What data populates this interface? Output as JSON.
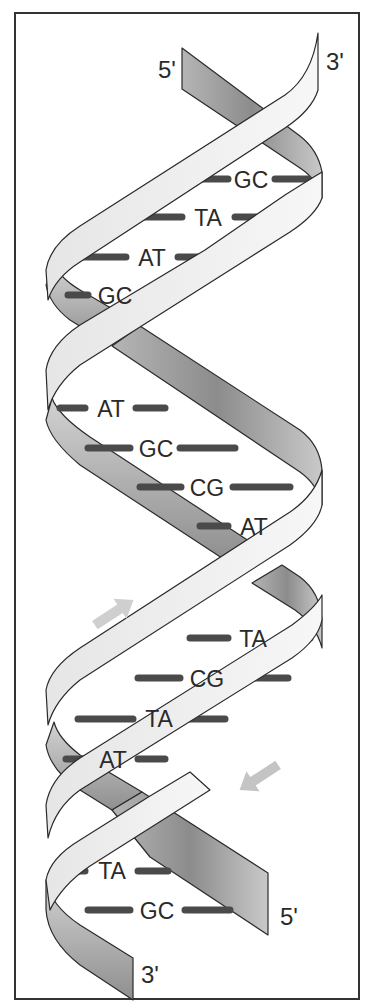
{
  "diagram": {
    "frame": {
      "border_color": "#333333",
      "background": "#ffffff"
    },
    "colors": {
      "light_strand": "#f2f2f2",
      "dark_strand_light": "#d0d0d0",
      "dark_strand_dark": "#8a8a8a",
      "bond": "#4a4a4a",
      "arrow": "#c8c8c8"
    },
    "end_labels": {
      "top_left": "5'",
      "top_right": "3'",
      "bottom_right": "5'",
      "bottom_left": "3'"
    },
    "base_pairs": [
      {
        "label": "GC",
        "y": 181
      },
      {
        "label": "TA",
        "y": 218
      },
      {
        "label": "AT",
        "y": 257
      },
      {
        "label": "GC",
        "y": 296
      },
      {
        "label": "AT",
        "y": 408
      },
      {
        "label": "GC",
        "y": 448
      },
      {
        "label": "CG",
        "y": 488
      },
      {
        "label": "AT",
        "y": 527
      },
      {
        "label": "TA",
        "y": 638
      },
      {
        "label": "CG",
        "y": 679
      },
      {
        "label": "TA",
        "y": 719
      },
      {
        "label": "AT",
        "y": 758
      },
      {
        "label": "TA",
        "y": 870
      },
      {
        "label": "GC",
        "y": 910
      }
    ],
    "arrows": [
      {
        "name": "upward-direction-arrow",
        "direction": "up-right"
      },
      {
        "name": "downward-direction-arrow",
        "direction": "down-left"
      }
    ]
  }
}
